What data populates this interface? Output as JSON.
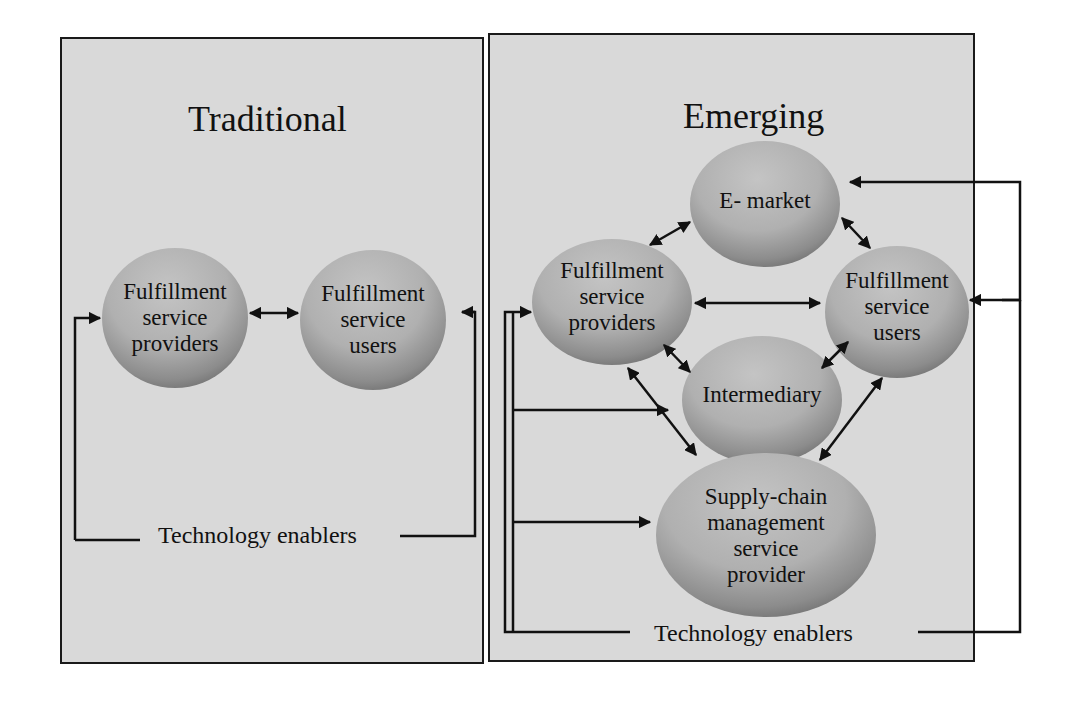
{
  "panels": {
    "traditional": {
      "title": "Traditional",
      "nodes": {
        "providers": "Fulfillment\nservice\nproviders",
        "users": "Fulfillment\nservice\nusers"
      },
      "enablers_label": "Technology enablers"
    },
    "emerging": {
      "title": "Emerging",
      "nodes": {
        "emarket": "E- market",
        "providers": "Fulfillment\nservice\nproviders",
        "users": "Fulfillment\nservice\nusers",
        "intermediary": "Intermediary",
        "scm": "Supply-chain\nmanagement\nservice\nprovider"
      },
      "enablers_label": "Technology enablers"
    }
  },
  "colors": {
    "panel_bg": "#d9d9d9",
    "node_fill": "#b0b0b0",
    "line": "#111111"
  }
}
